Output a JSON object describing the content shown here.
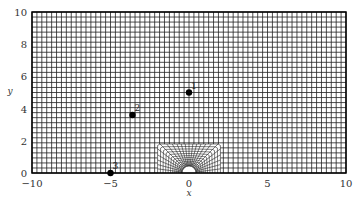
{
  "chart_data": {
    "type": "scatter",
    "title": "",
    "xlabel": "x",
    "ylabel": "y",
    "xlim": [
      -10,
      10
    ],
    "ylim": [
      0,
      10
    ],
    "x_ticks": [
      "-10",
      "-5",
      "0",
      "5",
      "10"
    ],
    "y_ticks": [
      "0",
      "2",
      "4",
      "6",
      "8",
      "10"
    ],
    "grid": "structured mesh, uniform cells (~64 x 32) with refined O-grid around a semicircular obstacle at origin",
    "mesh": {
      "uniform_cells_x": 64,
      "uniform_cells_y": 32,
      "refined_region": {
        "x": [
          -2,
          2
        ],
        "y": [
          0,
          1.8
        ]
      },
      "obstacle": {
        "shape": "semicircle",
        "center": [
          0,
          0
        ],
        "radius": 0.45
      }
    },
    "series": [
      {
        "name": "points",
        "points": [
          {
            "label": "1",
            "x": 0.0,
            "y": 5.0
          },
          {
            "label": "2",
            "x": -3.6,
            "y": 3.6
          },
          {
            "label": "3",
            "x": -5.0,
            "y": 0.0
          }
        ]
      }
    ],
    "legend": null
  },
  "colors": {
    "grid": "#222222",
    "axis": "#000000",
    "point": "#000000",
    "background": "#ffffff"
  }
}
